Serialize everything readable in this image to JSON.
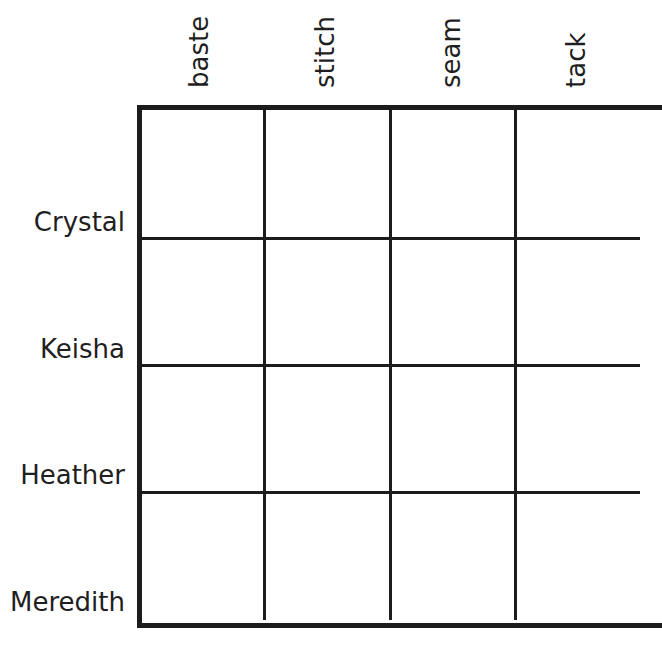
{
  "puzzle": {
    "type": "logic-grid",
    "columns": [
      {
        "label": "baste"
      },
      {
        "label": "stitch"
      },
      {
        "label": "seam"
      },
      {
        "label": "tack"
      }
    ],
    "rows": [
      {
        "label": "Crystal"
      },
      {
        "label": "Keisha"
      },
      {
        "label": "Heather"
      },
      {
        "label": "Meredith"
      }
    ],
    "cells": [
      [
        "",
        "",
        "",
        ""
      ],
      [
        "",
        "",
        "",
        ""
      ],
      [
        "",
        "",
        "",
        ""
      ],
      [
        "",
        "",
        "",
        ""
      ]
    ],
    "line_color": "#1c1c1c",
    "background": "#ffffff"
  }
}
